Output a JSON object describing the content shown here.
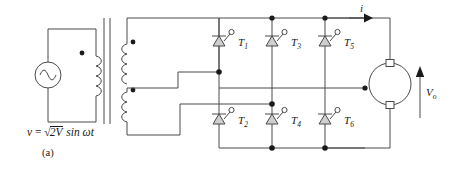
{
  "figure": {
    "caption": "(a)",
    "source_equation": {
      "lhs": "v",
      "eq": " = ",
      "radical_glyph": "√",
      "radicand": "2V",
      "rhs": " sin ωt",
      "full_text": "v = √2V sin ωt"
    }
  },
  "source": {
    "type": "ac-voltage-source",
    "symbol": "sine-wave"
  },
  "transformer": {
    "primary_polarity_dot": "•",
    "secondary_polarity_dot_1": "•",
    "secondary_polarity_dot_2": "•",
    "core_lines": 2,
    "primary_windings": 1,
    "secondary_windings": 3
  },
  "bridge": {
    "upper_thyristors": [
      {
        "label": "T",
        "sub": "1"
      },
      {
        "label": "T",
        "sub": "3"
      },
      {
        "label": "T",
        "sub": "5"
      }
    ],
    "lower_thyristors": [
      {
        "label": "T",
        "sub": "2"
      },
      {
        "label": "T",
        "sub": "4"
      },
      {
        "label": "T",
        "sub": "6"
      }
    ]
  },
  "output": {
    "current_label": "i",
    "voltage_label": "V",
    "voltage_sub": "o",
    "load": "dc-motor"
  },
  "colors": {
    "wire": "#4a4a4a",
    "node": "#1a1a1a",
    "thyristor_fill": "#cfcfcf",
    "text": "#1a1a1a",
    "background": "#ffffff"
  }
}
